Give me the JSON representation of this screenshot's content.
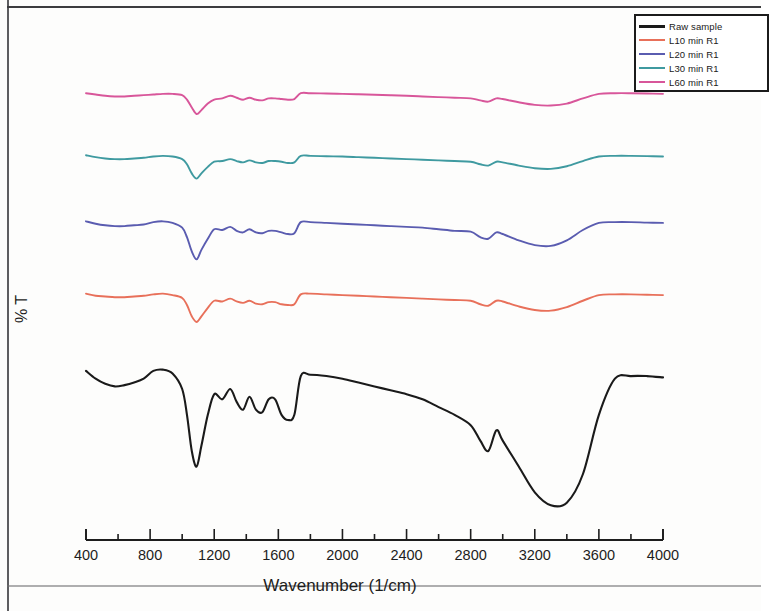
{
  "chart_data": {
    "type": "line",
    "title": "",
    "xlabel": "Wavenumber (1/cm)",
    "ylabel": "% T",
    "xlim": [
      400,
      4000
    ],
    "ylim": [
      0,
      100
    ],
    "grid": false,
    "x_major_ticks": [
      400,
      800,
      1200,
      1600,
      2000,
      2400,
      2800,
      3200,
      3600,
      4000
    ],
    "x_minor_tick_step": 200,
    "x_tick_labels": [
      "400",
      "800",
      "1200",
      "1600",
      "2000",
      "2400",
      "2800",
      "3200",
      "3600",
      "4000"
    ],
    "y_tick_labels": [],
    "y_axis_visible": false,
    "legend_position": "top-right",
    "note": "Stacked/offset FTIR transmittance spectra; each trace vertically offset for clarity",
    "series": [
      {
        "name": "L60 min R1",
        "color": "#d8569a",
        "offset_label": "top trace",
        "x": [
          400,
          460,
          520,
          580,
          640,
          700,
          760,
          820,
          880,
          940,
          1000,
          1030,
          1060,
          1090,
          1120,
          1160,
          1200,
          1250,
          1300,
          1340,
          1380,
          1420,
          1460,
          1500,
          1540,
          1580,
          1620,
          1660,
          1700,
          1740,
          1800,
          1900,
          2000,
          2100,
          2200,
          2300,
          2400,
          2500,
          2600,
          2700,
          2800,
          2860,
          2910,
          2960,
          3000,
          3100,
          3200,
          3300,
          3400,
          3500,
          3600,
          3700,
          3800,
          3900,
          4000
        ],
        "y": [
          96,
          95,
          94,
          93.5,
          93.5,
          94,
          94.5,
          95,
          95.5,
          95.5,
          94.5,
          91,
          85,
          80,
          83,
          88,
          91,
          92,
          94,
          92.5,
          91,
          92.5,
          91,
          90.5,
          92,
          92,
          91.5,
          91,
          91.5,
          96,
          96,
          95.8,
          95.5,
          95.2,
          94.8,
          94.4,
          94,
          93.5,
          93,
          92.5,
          92,
          90.5,
          89.5,
          92,
          91.5,
          89,
          87,
          86.5,
          88,
          92,
          95.5,
          96,
          96,
          95.8,
          95.5
        ]
      },
      {
        "name": "L30 min R1",
        "color": "#3f9aa0",
        "offset_label": "2nd trace",
        "x": [
          400,
          460,
          520,
          580,
          640,
          700,
          760,
          820,
          880,
          940,
          1000,
          1030,
          1060,
          1090,
          1120,
          1160,
          1200,
          1250,
          1300,
          1340,
          1380,
          1420,
          1460,
          1500,
          1540,
          1580,
          1620,
          1660,
          1700,
          1740,
          1800,
          1900,
          2000,
          2100,
          2200,
          2300,
          2400,
          2500,
          2600,
          2700,
          2800,
          2860,
          2910,
          2960,
          3000,
          3100,
          3200,
          3300,
          3400,
          3500,
          3600,
          3700,
          3800,
          3900,
          4000
        ],
        "y": [
          96,
          94.5,
          93.5,
          93,
          93,
          93.5,
          94,
          95,
          95.5,
          95,
          93,
          89,
          82,
          78,
          82,
          87,
          91,
          91.5,
          93,
          91.5,
          90.5,
          92,
          90.5,
          90,
          91.5,
          91.5,
          91,
          90,
          90.5,
          95.5,
          95.5,
          95.2,
          95,
          94.5,
          94,
          93.5,
          93,
          92.5,
          92,
          91.5,
          91,
          89,
          88,
          91,
          90.5,
          88,
          86,
          85.5,
          87.5,
          91.5,
          95,
          95.5,
          95.5,
          95.3,
          95
        ]
      },
      {
        "name": "L20 min R1",
        "color": "#5a5cb0",
        "offset_label": "3rd trace",
        "x": [
          400,
          460,
          520,
          580,
          640,
          700,
          760,
          820,
          880,
          940,
          1000,
          1030,
          1060,
          1090,
          1120,
          1160,
          1200,
          1250,
          1300,
          1340,
          1380,
          1420,
          1460,
          1500,
          1540,
          1580,
          1620,
          1660,
          1700,
          1740,
          1800,
          1900,
          2000,
          2100,
          2200,
          2300,
          2400,
          2500,
          2600,
          2700,
          2800,
          2860,
          2910,
          2960,
          3000,
          3100,
          3200,
          3300,
          3400,
          3500,
          3600,
          3700,
          3800,
          3900,
          4000
        ],
        "y": [
          96,
          94.5,
          93.5,
          93,
          93,
          93.5,
          94,
          95.5,
          96,
          95,
          92,
          86,
          77,
          72,
          78,
          85,
          91,
          90.5,
          92.5,
          90,
          89,
          91,
          89,
          88.5,
          90,
          90,
          89,
          88,
          88.5,
          95.5,
          95.5,
          95,
          94.5,
          94,
          93.5,
          93,
          92.5,
          92,
          91,
          90,
          89.5,
          86,
          85,
          89,
          88,
          84,
          81,
          80.5,
          84,
          90.5,
          95,
          95.5,
          95.5,
          95.2,
          95
        ]
      },
      {
        "name": "L10 min R1",
        "color": "#e8705a",
        "offset_label": "4th trace",
        "x": [
          400,
          460,
          520,
          580,
          640,
          700,
          760,
          820,
          880,
          940,
          1000,
          1030,
          1060,
          1090,
          1120,
          1160,
          1200,
          1250,
          1300,
          1340,
          1380,
          1420,
          1460,
          1500,
          1540,
          1580,
          1620,
          1660,
          1700,
          1740,
          1800,
          1900,
          2000,
          2100,
          2200,
          2300,
          2400,
          2500,
          2600,
          2700,
          2800,
          2860,
          2910,
          2960,
          3000,
          3100,
          3200,
          3300,
          3400,
          3500,
          3600,
          3700,
          3800,
          3900,
          4000
        ],
        "y": [
          96,
          94.5,
          94,
          93.5,
          93.5,
          94,
          94.5,
          95.5,
          96,
          95,
          93,
          88,
          80,
          76,
          80,
          86,
          91,
          90.5,
          92.5,
          90.5,
          89.5,
          91,
          89,
          88.5,
          90,
          90,
          88.5,
          88,
          88.5,
          95.5,
          96,
          95.5,
          95,
          94.5,
          94,
          93.5,
          93,
          92.5,
          92,
          91.5,
          91,
          88.5,
          87.5,
          91,
          90.5,
          87,
          84.5,
          84,
          86.5,
          91,
          95,
          95.5,
          95.5,
          95.2,
          95
        ]
      },
      {
        "name": "Raw sample",
        "color": "#1a1a1a",
        "offset_label": "bottom trace",
        "x": [
          400,
          460,
          520,
          580,
          640,
          700,
          760,
          820,
          880,
          940,
          1000,
          1030,
          1060,
          1090,
          1120,
          1160,
          1200,
          1250,
          1300,
          1340,
          1380,
          1420,
          1460,
          1500,
          1540,
          1580,
          1620,
          1660,
          1700,
          1740,
          1800,
          1900,
          2000,
          2100,
          2200,
          2300,
          2400,
          2500,
          2600,
          2700,
          2800,
          2860,
          2910,
          2960,
          3000,
          3100,
          3200,
          3300,
          3400,
          3500,
          3600,
          3700,
          3800,
          3900,
          4000
        ],
        "y": [
          95,
          92,
          90,
          89,
          89.5,
          90.5,
          92,
          95,
          95.5,
          94,
          88,
          78,
          64,
          58,
          66,
          78,
          86,
          84,
          88,
          83,
          80,
          85,
          80,
          79,
          84,
          84,
          78,
          76,
          78,
          93,
          93.5,
          93,
          92,
          90.5,
          89,
          87.5,
          86,
          84,
          81,
          78,
          74,
          68,
          64,
          72,
          68,
          58,
          48,
          43,
          44,
          55,
          78,
          92,
          93,
          93,
          92.5
        ]
      }
    ]
  },
  "legend": {
    "items": [
      {
        "label": "Raw sample",
        "color": "#1a1a1a"
      },
      {
        "label": "L10 min R1",
        "color": "#e8705a"
      },
      {
        "label": "L20 min R1",
        "color": "#5a5cb0"
      },
      {
        "label": "L30 min R1",
        "color": "#3f9aa0"
      },
      {
        "label": "L60 min R1",
        "color": "#d8569a"
      }
    ]
  },
  "axes": {
    "x_title": "Wavenumber (1/cm)",
    "y_title": "% T",
    "x_ticks": [
      "400",
      "800",
      "1200",
      "1600",
      "2000",
      "2400",
      "2800",
      "3200",
      "3600",
      "4000"
    ]
  }
}
